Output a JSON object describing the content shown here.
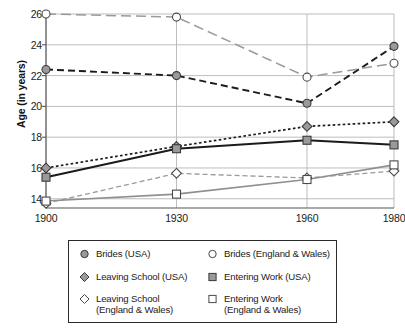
{
  "chart_data": {
    "type": "line",
    "title": "",
    "xlabel": "",
    "ylabel": "Age (in years)",
    "x": [
      1900,
      1930,
      1960,
      1980
    ],
    "categories": [
      "1900",
      "1930",
      "1960",
      "1980"
    ],
    "xtick_labels": [
      "1900",
      "1930",
      "1960",
      "1980"
    ],
    "ytick_labels": [
      "14",
      "16",
      "18",
      "20",
      "22",
      "24",
      "26"
    ],
    "yticks": [
      14,
      16,
      18,
      20,
      22,
      24,
      26
    ],
    "ylim": [
      13.4,
      26
    ],
    "xlim": [
      1900,
      1980
    ],
    "grid": "horizontal-and-vertical",
    "legend_position": "below-plot",
    "series": [
      {
        "name": "Brides (USA)",
        "values": [
          22.4,
          22.0,
          20.2,
          23.9
        ],
        "marker": "circle",
        "marker_fill": "#9a9a9a",
        "marker_stroke": "#3a3a3a",
        "line_color": "#1b1b1b",
        "line_style": "dashed",
        "line_width": 1.9
      },
      {
        "name": "Brides (England & Wales)",
        "values": [
          26.0,
          25.8,
          21.9,
          22.8
        ],
        "marker": "circle",
        "marker_fill": "#ffffff",
        "marker_stroke": "#4a4a4a",
        "line_color": "#9a9a9a",
        "line_style": "long-dashed",
        "line_width": 1.5
      },
      {
        "name": "Leaving School (USA)",
        "values": [
          16.0,
          17.4,
          18.7,
          19.0
        ],
        "marker": "diamond",
        "marker_fill": "#9a9a9a",
        "marker_stroke": "#3a3a3a",
        "line_color": "#1b1b1b",
        "line_style": "dotted",
        "line_width": 1.7
      },
      {
        "name": "Entering Work (USA)",
        "values": [
          15.4,
          17.25,
          17.8,
          17.5
        ],
        "marker": "square",
        "marker_fill": "#9a9a9a",
        "marker_stroke": "#3a3a3a",
        "line_color": "#1b1b1b",
        "line_style": "solid",
        "line_width": 2.0
      },
      {
        "name": "Leaving School (England & Wales)",
        "values": [
          13.7,
          15.65,
          15.35,
          15.8
        ],
        "marker": "diamond",
        "marker_fill": "#ffffff",
        "marker_stroke": "#4a4a4a",
        "line_color": "#9a9a9a",
        "line_style": "dashed",
        "line_width": 1.3
      },
      {
        "name": "Entering Work (England & Wales)",
        "values": [
          13.85,
          14.3,
          15.25,
          16.2
        ],
        "marker": "square",
        "marker_fill": "#ffffff",
        "marker_stroke": "#4a4a4a",
        "line_color": "#8f8f8f",
        "line_style": "solid",
        "line_width": 1.6
      }
    ]
  },
  "axis": {
    "ylabel": "Age (in years)"
  },
  "legend": {
    "items": [
      {
        "label": "Brides (USA)",
        "marker": "circle",
        "fill": "#9a9a9a",
        "stroke": "#3a3a3a"
      },
      {
        "label": "Brides (England & Wales)",
        "marker": "circle",
        "fill": "#ffffff",
        "stroke": "#4a4a4a"
      },
      {
        "label": "Leaving School (USA)",
        "marker": "diamond",
        "fill": "#9a9a9a",
        "stroke": "#3a3a3a"
      },
      {
        "label": "Entering Work (USA)",
        "marker": "square",
        "fill": "#9a9a9a",
        "stroke": "#3a3a3a"
      },
      {
        "label": "Leaving School\n(England & Wales)",
        "marker": "diamond",
        "fill": "#ffffff",
        "stroke": "#4a4a4a"
      },
      {
        "label": "Entering Work\n(England & Wales)",
        "marker": "square",
        "fill": "#ffffff",
        "stroke": "#4a4a4a"
      }
    ]
  },
  "colors": {
    "grid": "#b6b6b6",
    "axis": "#555555",
    "text": "#1b1b1b",
    "legend_border": "#2b2b2b"
  }
}
